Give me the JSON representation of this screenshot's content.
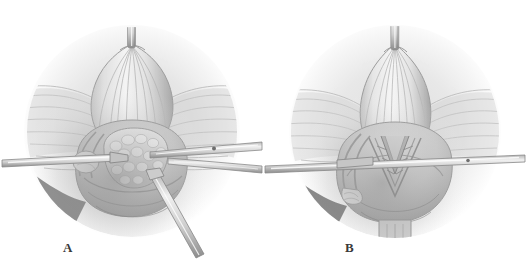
{
  "figure": {
    "medium": "graphite pencil rendering",
    "background_color": "#ffffff",
    "panel_count": 2
  },
  "panels": [
    {
      "id": "A",
      "label": "A",
      "caption_letter": "A",
      "description": "Open surgical field showing bladder dome retracted superiorly with catheter, radiating fascial fibers, lateral retractor blades, and an exposed nodular glandular mass held with a grasping instrument",
      "elements": {
        "catheter_label": "catheter",
        "dome_label": "bladder-dome",
        "mass_label": "nodular-mass",
        "left_retractor_label": "left-retractor",
        "right_retractor_label": "right-retractor",
        "forceps_label": "grasping-forceps",
        "vessel_label": "lateral-vessel"
      }
    },
    {
      "id": "B",
      "label": "B",
      "caption_letter": "B",
      "description": "Same surgical field after closure, showing a V-shaped sutured incision line, narrowed dome, horizontal retractor bar, and dependent tubular structure on the left",
      "elements": {
        "catheter_label": "catheter",
        "dome_label": "bladder-dome",
        "incision_label": "v-shaped-closure",
        "retractor_bar_label": "horizontal-retractor-bar",
        "tubular_label": "dependent-tubular-structure"
      }
    }
  ],
  "palette": {
    "background": "#ffffff",
    "lightest_tissue": "#f2f2f2",
    "light_tissue": "#e2e2e2",
    "mid_tissue": "#c8c8c8",
    "mid_dark_tissue": "#b0b0b0",
    "shadow": "#8e8e8e",
    "deep_shadow": "#5e5e5e",
    "instrument_metal": "#9a9a9a",
    "instrument_highlight": "#ededed",
    "outline": "#707070",
    "label_text": "#3a3a3a"
  }
}
